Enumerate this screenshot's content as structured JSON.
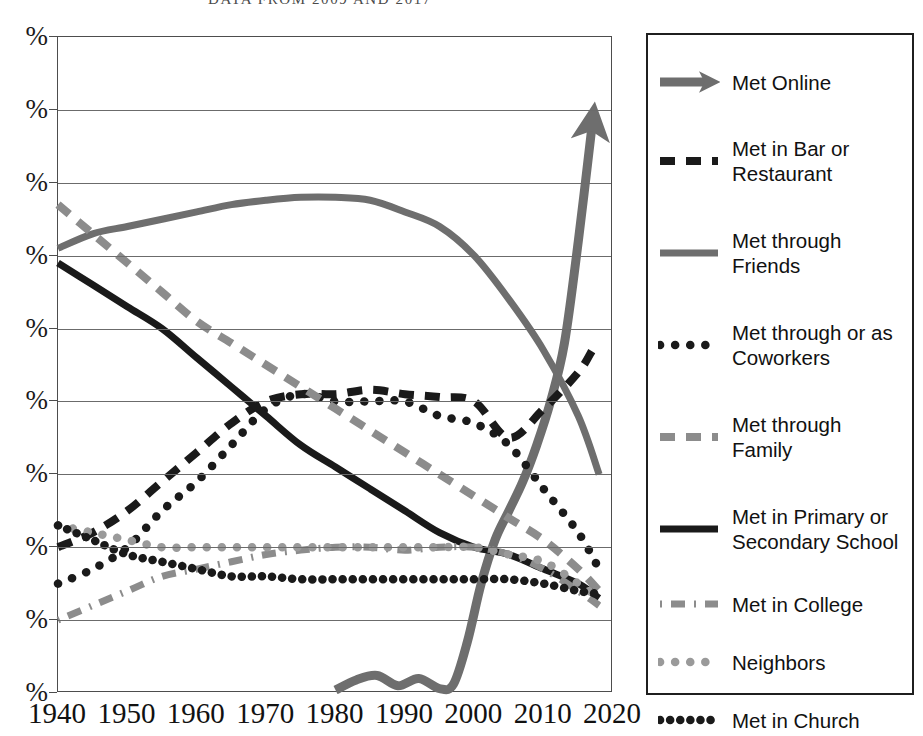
{
  "subtitle": "DATA FROM 2009 AND 2017",
  "colors": {
    "black": "#1a1a1a",
    "dark_gray": "#6e6e6e",
    "mid_gray": "#8c8c8c",
    "light_gray": "#9a9a9a",
    "grid": "#6b6b6b",
    "frame": "#4d4d4d",
    "background": "#ffffff"
  },
  "legend": {
    "items": [
      {
        "label": "Met Online",
        "style": "solid-arrow",
        "color": "#6e6e6e",
        "swatch": "met-online-swatch"
      },
      {
        "label": "Met in Bar or Restaurant",
        "style": "dashed",
        "color": "#1a1a1a",
        "swatch": "met-bar-restaurant-swatch"
      },
      {
        "label": "Met through Friends",
        "style": "solid",
        "color": "#6e6e6e",
        "swatch": "met-friends-swatch"
      },
      {
        "label": "Met through or as Coworkers",
        "style": "dotted-large",
        "color": "#1a1a1a",
        "swatch": "met-coworkers-swatch"
      },
      {
        "label": "Met through Family",
        "style": "dashed",
        "color": "#8c8c8c",
        "swatch": "met-family-swatch"
      },
      {
        "label": "Met in Primary or Secondary School",
        "style": "solid",
        "color": "#1a1a1a",
        "swatch": "met-school-swatch"
      },
      {
        "label": "Met in College",
        "style": "dash-dot",
        "color": "#8c8c8c",
        "swatch": "met-college-swatch"
      },
      {
        "label": "Neighbors",
        "style": "dotted-large",
        "color": "#9a9a9a",
        "swatch": "neighbors-swatch"
      },
      {
        "label": "Met in Church",
        "style": "dotted-dense",
        "color": "#1a1a1a",
        "swatch": "met-church-swatch"
      }
    ]
  },
  "chart_data": {
    "type": "line",
    "title": "",
    "subtitle": "DATA FROM 2009 AND 2017",
    "xlabel": "",
    "ylabel": "%",
    "xlim": [
      1940,
      2020
    ],
    "ylim": [
      0,
      45
    ],
    "grid": true,
    "legend_position": "right",
    "x_ticks": [
      1940,
      1950,
      1960,
      1970,
      1980,
      1990,
      2000,
      2010,
      2020
    ],
    "y_ticks": [
      0,
      5,
      10,
      15,
      20,
      25,
      30,
      35,
      40,
      45
    ],
    "y_tick_labels": [
      "%",
      "%",
      "%",
      "%",
      "%",
      "%",
      "%",
      "%",
      "%",
      "%"
    ],
    "y_tick_note": "Numeric portion of each y tick label is cropped off the left edge of the screenshot; only the percent sign is visible.",
    "series": [
      {
        "name": "Met Online",
        "color": "#6e6e6e",
        "style": "solid-arrow",
        "x": [
          1980,
          1983,
          1986,
          1989,
          1992,
          1995,
          1997,
          1999,
          2001,
          2003,
          2005,
          2007,
          2009,
          2011,
          2013,
          2015,
          2017
        ],
        "values": [
          0.2,
          0.9,
          1.2,
          0.5,
          1.0,
          0.3,
          0.6,
          3.5,
          7.5,
          10.5,
          12.5,
          14.5,
          17.0,
          20.0,
          24.0,
          31.0,
          39.0
        ]
      },
      {
        "name": "Met in Bar or Restaurant",
        "color": "#1a1a1a",
        "style": "dashed",
        "x": [
          1940,
          1945,
          1950,
          1955,
          1960,
          1965,
          1970,
          1975,
          1980,
          1985,
          1990,
          1995,
          2000,
          2005,
          2010,
          2015,
          2017
        ],
        "values": [
          10.0,
          11.0,
          12.5,
          14.5,
          16.5,
          18.5,
          20.0,
          20.5,
          20.5,
          20.8,
          20.5,
          20.3,
          20.0,
          17.5,
          19.5,
          22.0,
          23.5
        ]
      },
      {
        "name": "Met through Friends",
        "color": "#6e6e6e",
        "style": "solid",
        "x": [
          1940,
          1945,
          1950,
          1955,
          1960,
          1965,
          1970,
          1975,
          1980,
          1985,
          1990,
          1995,
          2000,
          2005,
          2010,
          2015,
          2018
        ],
        "values": [
          30.5,
          31.5,
          32.0,
          32.5,
          33.0,
          33.5,
          33.8,
          34.0,
          34.0,
          33.8,
          33.0,
          32.0,
          30.0,
          27.0,
          23.5,
          19.0,
          15.0
        ]
      },
      {
        "name": "Met through or as Coworkers",
        "color": "#1a1a1a",
        "style": "dotted-large",
        "x": [
          1940,
          1945,
          1950,
          1955,
          1960,
          1965,
          1970,
          1975,
          1980,
          1985,
          1990,
          1995,
          2000,
          2005,
          2010,
          2015,
          2018
        ],
        "values": [
          7.5,
          8.5,
          10.0,
          12.5,
          14.5,
          17.0,
          19.5,
          20.5,
          20.0,
          20.0,
          20.0,
          19.0,
          18.5,
          17.0,
          14.0,
          11.0,
          8.5
        ]
      },
      {
        "name": "Met through Family",
        "color": "#8c8c8c",
        "style": "dashed",
        "x": [
          1940,
          1945,
          1950,
          1955,
          1960,
          1965,
          1970,
          1975,
          1980,
          1985,
          1990,
          1995,
          2000,
          2005,
          2010,
          2015,
          2018
        ],
        "values": [
          33.5,
          31.5,
          29.5,
          27.5,
          25.5,
          24.0,
          22.5,
          21.0,
          19.5,
          18.0,
          16.5,
          15.0,
          13.5,
          12.0,
          10.5,
          8.5,
          7.0
        ]
      },
      {
        "name": "Met in Primary or Secondary School",
        "color": "#1a1a1a",
        "style": "solid",
        "x": [
          1940,
          1945,
          1950,
          1955,
          1960,
          1965,
          1970,
          1975,
          1980,
          1985,
          1990,
          1995,
          2000,
          2005,
          2010,
          2015,
          2018
        ],
        "values": [
          29.5,
          28.0,
          26.5,
          25.0,
          23.0,
          21.0,
          19.0,
          17.0,
          15.5,
          14.0,
          12.5,
          11.0,
          10.0,
          9.5,
          8.5,
          7.5,
          6.5
        ]
      },
      {
        "name": "Met in College",
        "color": "#8c8c8c",
        "style": "dash-dot",
        "x": [
          1940,
          1945,
          1950,
          1955,
          1960,
          1965,
          1970,
          1975,
          1980,
          1985,
          1990,
          1995,
          2000,
          2005,
          2010,
          2015,
          2018
        ],
        "values": [
          5.0,
          6.0,
          7.0,
          8.0,
          8.5,
          9.0,
          9.5,
          9.8,
          10.0,
          10.0,
          9.8,
          10.0,
          10.0,
          9.5,
          8.5,
          7.0,
          6.0
        ]
      },
      {
        "name": "Neighbors",
        "color": "#9a9a9a",
        "style": "dotted-large",
        "x": [
          1940,
          1945,
          1950,
          1955,
          1960,
          1965,
          1970,
          1975,
          1980,
          1985,
          1990,
          1995,
          2000,
          2005,
          2010,
          2015,
          2018
        ],
        "values": [
          11.5,
          11.0,
          10.5,
          10.0,
          10.0,
          10.0,
          10.0,
          10.0,
          10.0,
          10.0,
          10.0,
          10.0,
          10.0,
          9.5,
          9.0,
          7.5,
          6.5
        ]
      },
      {
        "name": "Met in Church",
        "color": "#1a1a1a",
        "style": "dotted-dense",
        "x": [
          1940,
          1945,
          1950,
          1955,
          1960,
          1965,
          1970,
          1975,
          1980,
          1985,
          1990,
          1995,
          2000,
          2005,
          2010,
          2015,
          2018
        ],
        "values": [
          11.5,
          10.5,
          9.5,
          9.0,
          8.5,
          8.0,
          8.0,
          7.8,
          7.8,
          7.8,
          7.8,
          7.8,
          7.8,
          7.8,
          7.5,
          7.0,
          6.8
        ]
      }
    ]
  }
}
